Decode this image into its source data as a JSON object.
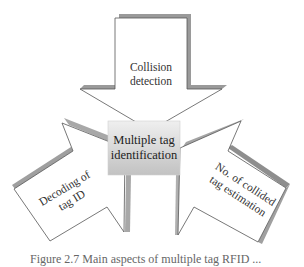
{
  "diagram": {
    "center": {
      "label_line1": "Multiple tag",
      "label_line2": "identification"
    },
    "top_arrow": {
      "label_line1": "Collision",
      "label_line2": "detection"
    },
    "left_arrow": {
      "label_line1": "Decoding of",
      "label_line2": "tag ID"
    },
    "right_arrow": {
      "label_line1": "No. of collided",
      "label_line2": "tag estimation"
    },
    "caption": "Figure 2.7  Main aspects of multiple tag RFID ...",
    "colors": {
      "arrow_fill": "#ffffff",
      "arrow_stroke": "#555555",
      "shadow": "#9a9a9a",
      "box_top": "#eeeeee",
      "box_bottom": "#c4c4c4"
    }
  }
}
